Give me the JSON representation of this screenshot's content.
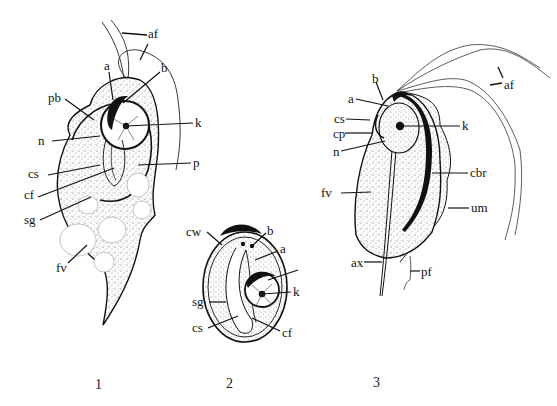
{
  "figure": {
    "panels": [
      {
        "number": "1",
        "labels": {
          "af": "af",
          "a": "a",
          "b": "b",
          "pb": "pb",
          "k": "k",
          "n": "n",
          "p": "p",
          "cs": "cs",
          "cf": "cf",
          "sg": "sg",
          "fv": "fv"
        }
      },
      {
        "number": "2",
        "labels": {
          "cw": "cw",
          "b": "b",
          "a": "a",
          "k": "k",
          "sg": "sg",
          "cs": "cs",
          "cf": "cf"
        }
      },
      {
        "number": "3",
        "labels": {
          "b": "b",
          "af": "af",
          "a": "a",
          "cs": "cs",
          "k": "k",
          "cp": "cp",
          "n": "n",
          "cbr": "cbr",
          "fv": "fv",
          "um": "um",
          "ax": "ax",
          "pf": "pf"
        }
      }
    ]
  }
}
